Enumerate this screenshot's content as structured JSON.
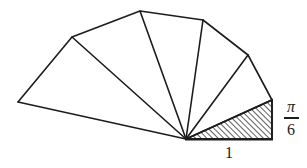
{
  "figure": {
    "background_color": "#ffffff",
    "stroke_color": "#1c1c1c",
    "width": 307,
    "height": 168,
    "apex": {
      "x": 186,
      "y": 139
    },
    "vertices": [
      {
        "id": "v0",
        "x": 272,
        "y": 139,
        "label": "base-right-corner"
      },
      {
        "id": "v1",
        "x": 272,
        "y": 100,
        "label": "first-hypotenuse-end"
      },
      {
        "id": "v2",
        "x": 248,
        "y": 55,
        "label": "second-hypotenuse-end"
      },
      {
        "id": "v3",
        "x": 203,
        "y": 20,
        "label": "third-hypotenuse-end"
      },
      {
        "id": "v4",
        "x": 140,
        "y": 11,
        "label": "fourth-hypotenuse-end"
      },
      {
        "id": "v5",
        "x": 72,
        "y": 37,
        "label": "fifth-hypotenuse-end"
      },
      {
        "id": "v6",
        "x": 18,
        "y": 102,
        "label": "sixth-hypotenuse-end"
      }
    ],
    "triangles": [
      {
        "id": "t1",
        "shaded": true,
        "points": "186,139 272,139 272,100"
      },
      {
        "id": "t2",
        "shaded": false,
        "points": "186,139 272,100 248,55"
      },
      {
        "id": "t3",
        "shaded": false,
        "points": "186,139 248,55 203,20"
      },
      {
        "id": "t4",
        "shaded": false,
        "points": "186,139 203,20 140,11"
      },
      {
        "id": "t5",
        "shaded": false,
        "points": "186,139 140,11 72,37"
      },
      {
        "id": "t6",
        "shaded": false,
        "points": "186,139 72,37 18,102"
      }
    ],
    "hatch": {
      "direction": "forward-slash",
      "spacing": 4,
      "stroke_width": 1.4,
      "color": "#1c1c1c"
    }
  },
  "labels": {
    "angle": {
      "numerator": "π",
      "denominator": "6",
      "full": "π/6"
    },
    "base_length": "1"
  }
}
